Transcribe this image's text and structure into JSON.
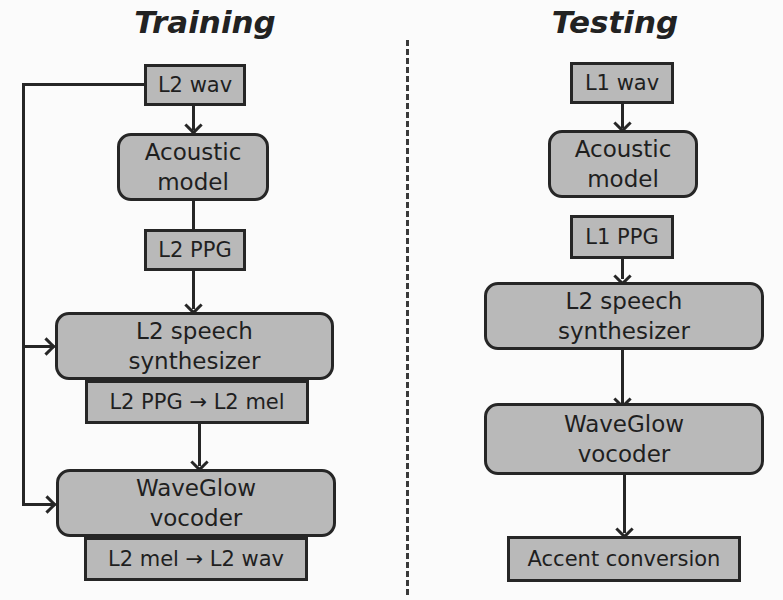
{
  "training": {
    "title": "Training",
    "nodes": [
      {
        "id": "l2-wav",
        "label": "L2 wav"
      },
      {
        "id": "acoustic-model",
        "label": "Acoustic model"
      },
      {
        "id": "l2-ppg",
        "label": "L2 PPG"
      },
      {
        "id": "l2-speech-synth",
        "label": "L2 speech synthesizer"
      },
      {
        "id": "l2-ppg-to-mel",
        "label": "L2 PPG → L2 mel"
      },
      {
        "id": "waveglow",
        "label": "WaveGlow vocoder"
      },
      {
        "id": "l2-mel-to-wav",
        "label": "L2 mel → L2 wav"
      }
    ]
  },
  "testing": {
    "title": "Testing",
    "nodes": [
      {
        "id": "l1-wav",
        "label": "L1 wav"
      },
      {
        "id": "acoustic-model",
        "label": "Acoustic model"
      },
      {
        "id": "l1-ppg",
        "label": "L1 PPG"
      },
      {
        "id": "l2-speech-synth",
        "label": "L2 speech synthesizer"
      },
      {
        "id": "waveglow",
        "label": "WaveGlow vocoder"
      },
      {
        "id": "accent-conversion",
        "label": "Accent conversion"
      }
    ]
  },
  "colors": {
    "box_fill": "#b9b9b9",
    "box_border": "#262626",
    "background": "#fbfbfb"
  }
}
